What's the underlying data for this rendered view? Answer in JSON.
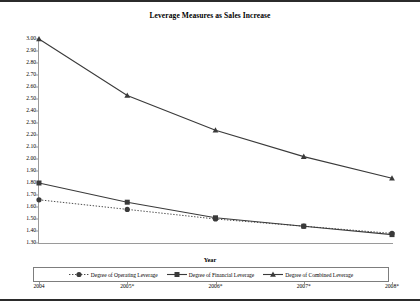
{
  "chart_data": {
    "type": "line",
    "title": "Leverage Measures as Sales Increase",
    "xlabel": "Year",
    "ylabel": "",
    "categories": [
      "2004",
      "2005*",
      "2006*",
      "2007*",
      "2008*"
    ],
    "ylim": [
      1.3,
      3.0
    ],
    "ytick_step": 0.1,
    "ytick_labels": [
      "3.00",
      "2.90",
      "2.80",
      "2.70",
      "2.60",
      "2.50",
      "2.40",
      "2.30",
      "2.20",
      "2.10",
      "2.00",
      "1.90",
      "1.80",
      "1.70",
      "1.60",
      "1.50",
      "1.40",
      "1.30"
    ],
    "grid": false,
    "legend_position": "bottom",
    "series": [
      {
        "name": "Degree of Operating Leverage",
        "marker": "circle",
        "line_style": "dotted",
        "color": "#3a3a3a",
        "values": [
          1.66,
          1.58,
          1.5,
          1.44,
          1.38
        ]
      },
      {
        "name": "Degree of Financial Leverage",
        "marker": "square",
        "line_style": "solid",
        "color": "#3a3a3a",
        "values": [
          1.8,
          1.64,
          1.51,
          1.44,
          1.37
        ]
      },
      {
        "name": "Degree of Combined Leverage",
        "marker": "triangle",
        "line_style": "solid",
        "color": "#3a3a3a",
        "values": [
          3.0,
          2.53,
          2.24,
          2.02,
          1.84
        ]
      }
    ]
  }
}
